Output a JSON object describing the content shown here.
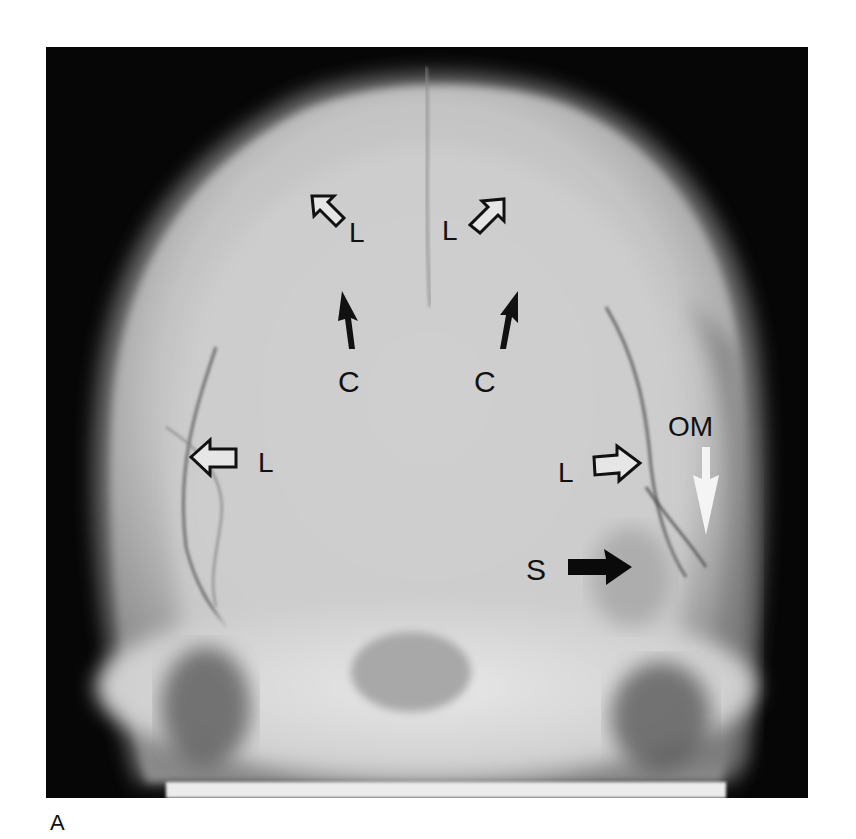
{
  "figure": {
    "panel_label": "A",
    "annotations": [
      {
        "text": "L",
        "arrow": "open-arrow-upleft",
        "position": "top-left"
      },
      {
        "text": "L",
        "arrow": "open-arrow-upright",
        "position": "top-right"
      },
      {
        "text": "C",
        "arrow": "solid-arrow-up",
        "position": "upper-left-center"
      },
      {
        "text": "C",
        "arrow": "solid-arrow-up",
        "position": "upper-right-center"
      },
      {
        "text": "L",
        "arrow": "open-arrow-left",
        "position": "mid-left"
      },
      {
        "text": "L",
        "arrow": "open-arrow-right",
        "position": "mid-right"
      },
      {
        "text": "OM",
        "arrow": "white-arrow-down",
        "position": "right"
      },
      {
        "text": "S",
        "arrow": "solid-arrow-right",
        "position": "lower-right"
      }
    ],
    "colors": {
      "background": "#060606",
      "bone": "#d8d8d8",
      "page": "#ffffff",
      "label": "#111111"
    }
  }
}
